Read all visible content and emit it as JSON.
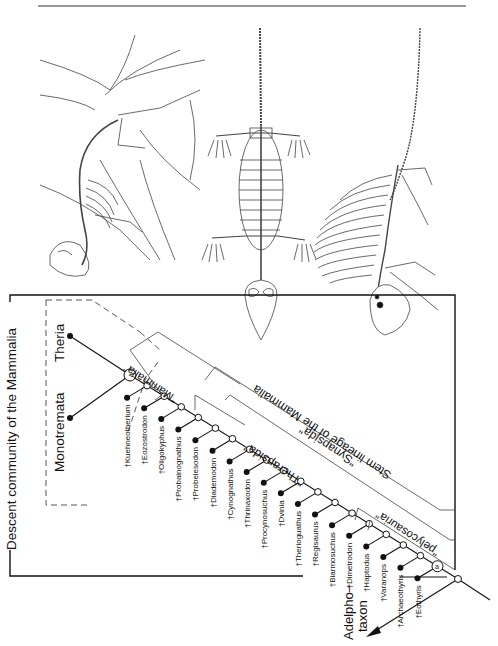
{
  "figure": {
    "frame_title": "Descent community of the Mammalia",
    "crown_groups": [
      "Monotremata",
      "Theria"
    ],
    "crown_node_symbol": "A",
    "base_node_symbol": "a",
    "adelphotaxon_label_line1": "Adelpho–",
    "adelphotaxon_label_line2": "taxon",
    "brackets": {
      "mammalia": "\"Mammalia\"",
      "therapsida": "\"Therapsida\"",
      "synapsida": "\"Synapsida\"",
      "stem_lineage": "Stem lineage of the Mammalia",
      "pelycosauria": "\"pelycosauria\""
    },
    "fossil_taxa": [
      "†Kuehneotherium",
      "†Eozostrodon",
      "†Oligokyphus",
      "†Probainognathus",
      "†Probelesodon",
      "†Diademodon",
      "†Cynognathus",
      "†Thrinaxodon",
      "†Procynosuchus",
      "†Dvinia",
      "†Therioguathus",
      "†Regisaurus",
      "†Biarmosuchus",
      "†Dimetrodon",
      "†Haptodus",
      "†Varanops",
      "†Archaeothyris",
      "†Eothyris"
    ],
    "illustrations": [
      "early-mammal-skeleton-on-branch",
      "therapsid-skeleton-dorsal-view",
      "dimetrodon-sail-back-skeleton"
    ]
  }
}
